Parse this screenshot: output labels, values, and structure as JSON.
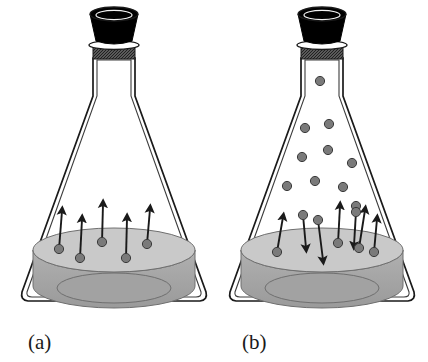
{
  "figure": {
    "background_color": "#ffffff",
    "line_color": "#1a1a1a",
    "stopper_color": "#000000",
    "collar_color": "#4a4a4a",
    "molecule_fill": "#7a7a7a",
    "molecule_stroke": "#3a3a3a",
    "liquid_top_color": "#c9c9c9",
    "liquid_body_color": "#a8a8a8",
    "liquid_bottom_color": "#9c9c9c"
  },
  "panels": [
    {
      "id": "a",
      "label": "(a)",
      "label_x": 28,
      "label_y": 349,
      "description": "Liquid evaporating; molecules leaving the surface only, vapor space empty",
      "flask": {
        "center_x": 114,
        "stopper": {
          "x": 90,
          "y": 8,
          "width": 48,
          "height": 34
        },
        "collar": {
          "x": 93,
          "y": 47,
          "width": 42,
          "height": 12
        },
        "neck": {
          "left": 93,
          "right": 135,
          "top": 44,
          "bottom": 62
        },
        "body_bottom_y": 300,
        "base_left": 22,
        "base_right": 206
      },
      "liquid": {
        "surface_cy": 250,
        "surface_rx": 81,
        "surface_ry": 22,
        "depth": 38
      },
      "surface_molecules": [
        {
          "x": 59,
          "y": 249,
          "arrow_dx": 3,
          "arrow_dy": -38
        },
        {
          "x": 80,
          "y": 258,
          "arrow_dx": 2,
          "arrow_dy": -39
        },
        {
          "x": 102,
          "y": 242,
          "arrow_dx": 1,
          "arrow_dy": -38
        },
        {
          "x": 126,
          "y": 258,
          "arrow_dx": 1,
          "arrow_dy": -40
        },
        {
          "x": 147,
          "y": 244,
          "arrow_dx": 3,
          "arrow_dy": -35
        }
      ],
      "vapor_molecules": []
    },
    {
      "id": "b",
      "label": "(b)",
      "label_x": 242,
      "label_y": 349,
      "description": "Dynamic equilibrium; equal numbers of molecules evaporating and condensing, vapor space filled",
      "flask": {
        "center_x": 322,
        "stopper": {
          "x": 298,
          "y": 8,
          "width": 48,
          "height": 34
        },
        "collar": {
          "x": 301,
          "y": 47,
          "width": 42,
          "height": 12
        },
        "neck": {
          "left": 301,
          "right": 343,
          "top": 44,
          "bottom": 62
        },
        "body_bottom_y": 300,
        "base_left": 230,
        "base_right": 414
      },
      "liquid": {
        "surface_cy": 250,
        "surface_rx": 81,
        "surface_ry": 22,
        "depth": 38
      },
      "surface_molecules": [
        {
          "x": 277,
          "y": 252,
          "arrow_dx": 6,
          "arrow_dy": -35,
          "direction": "up"
        },
        {
          "x": 303,
          "y": 215,
          "arrow_dx": 3,
          "arrow_dy": 33,
          "direction": "down"
        },
        {
          "x": 318,
          "y": 220,
          "arrow_dx": 5,
          "arrow_dy": 40,
          "direction": "down"
        },
        {
          "x": 338,
          "y": 243,
          "arrow_dx": 2,
          "arrow_dy": -37,
          "direction": "up"
        },
        {
          "x": 356,
          "y": 212,
          "arrow_dx": -2,
          "arrow_dy": 33,
          "direction": "down"
        },
        {
          "x": 359,
          "y": 248,
          "arrow_dx": 6,
          "arrow_dy": -38,
          "direction": "up"
        },
        {
          "x": 374,
          "y": 252,
          "arrow_dx": 3,
          "arrow_dy": -33,
          "direction": "up"
        }
      ],
      "vapor_molecules": [
        {
          "x": 320,
          "y": 81
        },
        {
          "x": 305,
          "y": 128
        },
        {
          "x": 329,
          "y": 124
        },
        {
          "x": 302,
          "y": 157
        },
        {
          "x": 328,
          "y": 150
        },
        {
          "x": 352,
          "y": 163
        },
        {
          "x": 287,
          "y": 186
        },
        {
          "x": 315,
          "y": 181
        },
        {
          "x": 343,
          "y": 187
        },
        {
          "x": 356,
          "y": 206
        }
      ]
    }
  ]
}
